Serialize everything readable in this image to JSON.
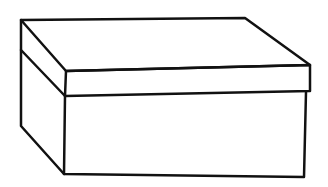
{
  "image": {
    "subject": "box-with-lid-line-drawing",
    "stroke_color": "#111111",
    "background": "#ffffff"
  }
}
